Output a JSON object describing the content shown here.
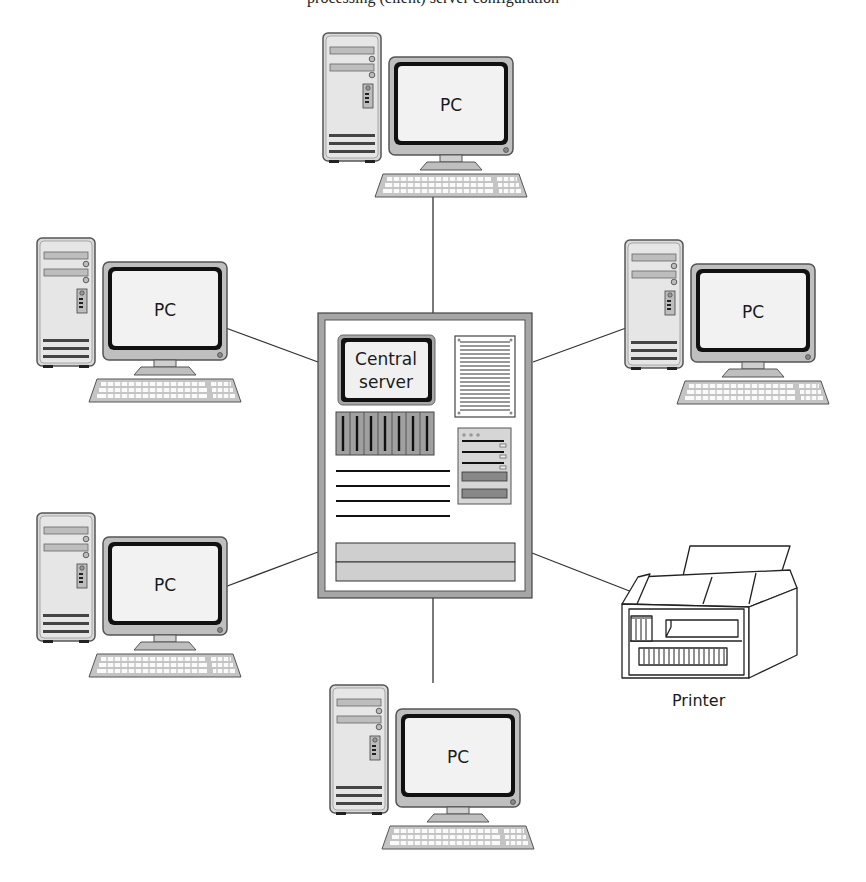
{
  "diagram": {
    "type": "star-network-topology",
    "cutoff_caption": "processing (client) server configuration",
    "hub": {
      "id": "server",
      "label_line1": "Central",
      "label_line2": "server"
    },
    "nodes": [
      {
        "id": "pc-top",
        "label": "PC"
      },
      {
        "id": "pc-left-top",
        "label": "PC"
      },
      {
        "id": "pc-right-top",
        "label": "PC"
      },
      {
        "id": "pc-left-bottom",
        "label": "PC"
      },
      {
        "id": "pc-bottom",
        "label": "PC"
      },
      {
        "id": "printer",
        "label": "Printer"
      }
    ],
    "edges": [
      {
        "from": "server",
        "to": "pc-top"
      },
      {
        "from": "server",
        "to": "pc-left-top"
      },
      {
        "from": "server",
        "to": "pc-right-top"
      },
      {
        "from": "server",
        "to": "pc-left-bottom"
      },
      {
        "from": "server",
        "to": "pc-bottom"
      },
      {
        "from": "server",
        "to": "printer"
      }
    ],
    "colors": {
      "frame_gray": "#a6a6a6",
      "screen": "#f2f2f2",
      "outline": "#2b2b2b",
      "panel_gray": "#c8c8c8"
    }
  }
}
